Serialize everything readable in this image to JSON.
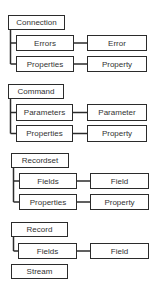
{
  "diagram": {
    "groups": [
      {
        "parent": {
          "label": "Connection",
          "box": [
            8,
            15,
            57,
            15
          ]
        },
        "children": [
          {
            "label": "Errors",
            "box": [
              16,
              35,
              58,
              16
            ],
            "item": {
              "label": "Error",
              "box": [
                87,
                35,
                60,
                16
              ]
            }
          },
          {
            "label": "Properties",
            "box": [
              16,
              56,
              58,
              16
            ],
            "item": {
              "label": "Property",
              "box": [
                87,
                56,
                60,
                16
              ]
            }
          }
        ]
      },
      {
        "parent": {
          "label": "Command",
          "box": [
            8,
            84,
            56,
            15
          ]
        },
        "children": [
          {
            "label": "Parameters",
            "box": [
              16,
              104,
              57,
              17
            ],
            "item": {
              "label": "Parameter",
              "box": [
                87,
                104,
                60,
                17
              ]
            }
          },
          {
            "label": "Properties",
            "box": [
              16,
              125,
              57,
              17
            ],
            "item": {
              "label": "Property",
              "box": [
                87,
                125,
                60,
                17
              ]
            }
          }
        ]
      },
      {
        "parent": {
          "label": "Recordset",
          "box": [
            11,
            153,
            58,
            15
          ]
        },
        "children": [
          {
            "label": "Fields",
            "box": [
              19,
              173,
              58,
              16
            ],
            "item": {
              "label": "Field",
              "box": [
                90,
                173,
                59,
                16
              ]
            }
          },
          {
            "label": "Properties",
            "box": [
              19,
              194,
              58,
              16
            ],
            "item": {
              "label": "Property",
              "box": [
                90,
                194,
                59,
                16
              ]
            }
          }
        ]
      },
      {
        "parent": {
          "label": "Record",
          "box": [
            11,
            222,
            57,
            15
          ]
        },
        "children": [
          {
            "label": "Fields",
            "box": [
              18,
              243,
              59,
              16
            ],
            "item": {
              "label": "Field",
              "box": [
                90,
                243,
                59,
                16
              ]
            }
          }
        ]
      },
      {
        "parent": {
          "label": "Stream",
          "box": [
            11,
            264,
            57,
            15
          ]
        },
        "children": []
      }
    ],
    "colors": {
      "line": "#2b2b2b",
      "text": "#333333",
      "background": "#ffffff"
    }
  }
}
